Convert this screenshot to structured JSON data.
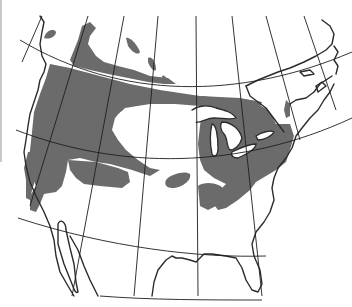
{
  "map": {
    "subject": "North America range map",
    "projection": "conic with graticule",
    "range_color": "#6b6b6b",
    "background_color": "#ffffff",
    "line_color": "#2b2b2b",
    "regions_shaded": [
      "Pacific Northwest and western mountains",
      "Boreal Canada band",
      "Northern Canada / Alaska patches",
      "Great Lakes and northeastern United States",
      "Isolated patch central plains"
    ],
    "labels": []
  }
}
